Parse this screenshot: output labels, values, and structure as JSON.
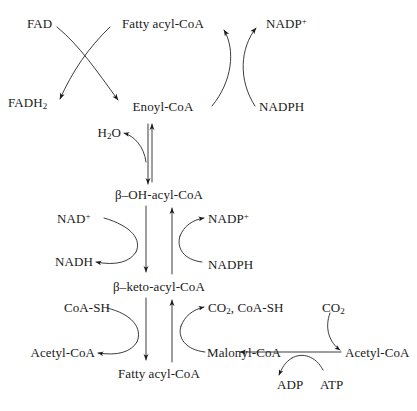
{
  "diagram": {
    "stroke_color": "#1a1a1a",
    "background_color": "#ffffff",
    "nodes": {
      "fad": "FAD",
      "fadh2_text": "FADH",
      "fadh2_sub": "2",
      "fatty_acyl_coa_top": "Fatty acyl-CoA",
      "nadp_plus_top_text": "NADP",
      "nadp_plus_top_sup": "+",
      "enoyl_coa": "Enoyl-CoA",
      "nadph_top": "NADPH",
      "water_text": "H",
      "water_sub": "2",
      "water_tail": "O",
      "beta_oh_acyl_coa": "β–OH-acyl-CoA",
      "nad_plus_text": "NAD",
      "nad_plus_sup": "+",
      "nadp_plus_mid_text": "NADP",
      "nadp_plus_mid_sup": "+",
      "nadh": "NADH",
      "nadph_mid": "NADPH",
      "beta_keto_acyl_coa": "β–keto-acyl-CoA",
      "coa_sh_left": "CoA-SH",
      "co2_coash_text": "CO",
      "co2_coash_sub": "2",
      "co2_coash_tail": ", CoA-SH",
      "co2_right_text": "CO",
      "co2_right_sub": "2",
      "acetyl_coa_left": "Acetyl-CoA",
      "malonyl_coa": "Malonyl-CoA",
      "acetyl_coa_right": "Acetyl-CoA",
      "fatty_acyl_coa_bottom": "Fatty acyl-CoA",
      "adp": "ADP",
      "atp": "ATP"
    }
  }
}
